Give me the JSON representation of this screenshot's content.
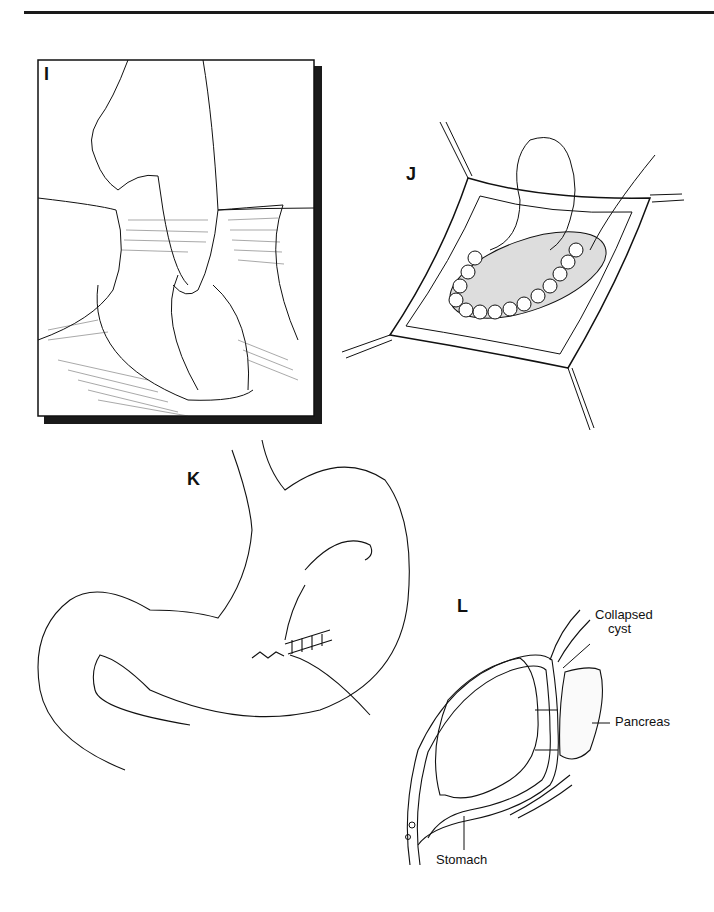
{
  "page": {
    "type": "surgical illustration plate",
    "top_rule": true
  },
  "panels": {
    "I": {
      "label": "I",
      "description": "Finger inserted through incision into cyst cavity; framed illustration with drop shadow"
    },
    "J": {
      "label": "J",
      "description": "Interrupted sutures around opening between stomach and cyst, retracted wound edges"
    },
    "K": {
      "label": "K",
      "description": "Stomach outline with closed anterior gastrotomy and running suture with needle"
    },
    "L": {
      "label": "L",
      "description": "Cross-section showing stomach sutured to collapsed cyst adjacent to pancreas",
      "callouts": {
        "collapsed_cyst_line1": "Collapsed",
        "collapsed_cyst_line2": "cyst",
        "pancreas": "Pancreas",
        "stomach": "Stomach"
      }
    }
  },
  "colors": {
    "ink": "#111111",
    "paper": "#ffffff",
    "rule": "#1a1a1a"
  }
}
